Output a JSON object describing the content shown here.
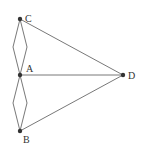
{
  "diagram": {
    "type": "graph",
    "nodes": [
      {
        "id": "C",
        "label": "C",
        "x": 20,
        "y": 19
      },
      {
        "id": "A",
        "label": "A",
        "x": 20,
        "y": 75
      },
      {
        "id": "B",
        "label": "B",
        "x": 20,
        "y": 131
      },
      {
        "id": "D",
        "label": "D",
        "x": 123,
        "y": 75
      }
    ],
    "edges": [
      {
        "from": "C",
        "to": "A",
        "curve": "left"
      },
      {
        "from": "C",
        "to": "A",
        "curve": "right"
      },
      {
        "from": "A",
        "to": "B",
        "curve": "left"
      },
      {
        "from": "A",
        "to": "B",
        "curve": "right"
      },
      {
        "from": "C",
        "to": "D"
      },
      {
        "from": "A",
        "to": "D"
      },
      {
        "from": "B",
        "to": "D"
      }
    ],
    "colors": {
      "line": "#555555",
      "node": "#333333",
      "background": "#ffffff"
    }
  }
}
